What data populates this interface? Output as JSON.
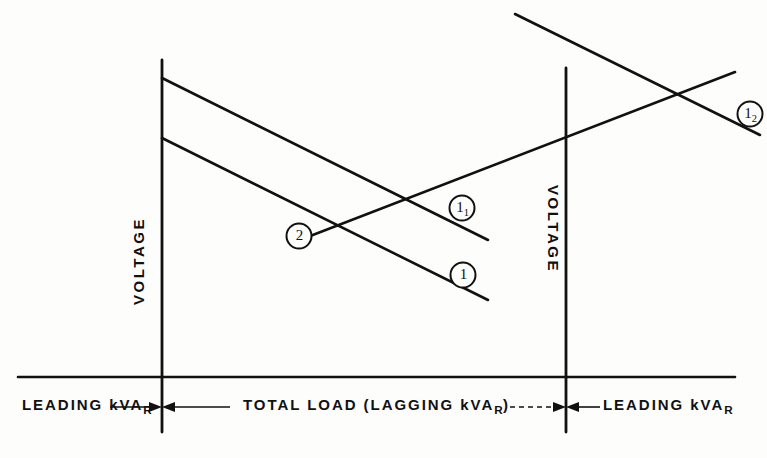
{
  "figure": {
    "background_color": "#fdfdfc",
    "ink_color": "#111111"
  },
  "axes": {
    "left_voltage_label": "VOLTAGE",
    "right_voltage_label": "VOLTAGE",
    "horizontal_left_label": "LEADING kVAR",
    "horizontal_center_label": "TOTAL LOAD (LAGGING kVAR)",
    "horizontal_right_label": "LEADING kVAR",
    "kvar_sub": "R"
  },
  "curve_labels": [
    {
      "id": "curve-2",
      "text": "2",
      "sub": ""
    },
    {
      "id": "curve-1-1",
      "text": "1",
      "sub": "1"
    },
    {
      "id": "curve-1",
      "text": "1",
      "sub": ""
    },
    {
      "id": "curve-1-2",
      "text": "1",
      "sub": "2"
    }
  ],
  "chart_data": {
    "type": "line",
    "title": "",
    "xlabel": "TOTAL LOAD (LAGGING kVAR)",
    "ylabel": "VOLTAGE",
    "grid": false,
    "legend": "inline-circled-callouts",
    "xlim": [
      0,
      767
    ],
    "ylim": [
      0,
      458
    ],
    "note": "Schematic voltage-regulation characteristic; coordinates are in image pixel space with y measured downward.",
    "regions": [
      {
        "name": "LEADING kVAR",
        "from_x": 18,
        "to_x": 162
      },
      {
        "name": "TOTAL LOAD (LAGGING kVAR)",
        "from_x": 162,
        "to_x": 566
      },
      {
        "name": "LEADING kVAR",
        "from_x": 566,
        "to_x": 735
      }
    ],
    "series": [
      {
        "name": "2",
        "style": "solid",
        "description": "Upper descending voltage-droop line starting at left voltage axis",
        "points": [
          [
            162,
            78
          ],
          [
            488,
            240
          ]
        ]
      },
      {
        "name": "1",
        "style": "solid",
        "description": "Lower descending voltage-droop line starting at left voltage axis",
        "points": [
          [
            162,
            138
          ],
          [
            488,
            300
          ]
        ]
      },
      {
        "name": "1₁",
        "style": "solid",
        "description": "Ascending line rising to the right from mid-plot",
        "points": [
          [
            305,
            238
          ],
          [
            735,
            72
          ]
        ]
      },
      {
        "name": "1₂",
        "style": "solid",
        "description": "Descending line from top of plot toward lower right",
        "points": [
          [
            515,
            14
          ],
          [
            757,
            133
          ]
        ]
      }
    ],
    "vertical_axis_lines": [
      {
        "name": "left-voltage-axis",
        "x": 162,
        "y_top": 60,
        "y_bottom": 432
      },
      {
        "name": "right-voltage-axis",
        "x": 566,
        "y_top": 68,
        "y_bottom": 432
      }
    ],
    "horizontal_axis_line": {
      "y": 377,
      "x_start": 18,
      "x_end": 735
    },
    "dimension_arrows": [
      {
        "name": "left-boundary-arrows",
        "x": 162,
        "y": 407
      },
      {
        "name": "right-boundary-arrows",
        "x": 566,
        "y": 407
      }
    ]
  }
}
